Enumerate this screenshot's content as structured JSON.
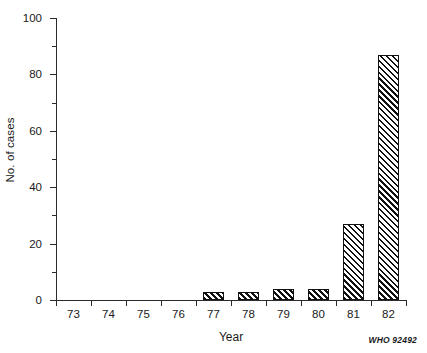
{
  "chart_data": {
    "type": "bar",
    "title": "",
    "subtitle": "",
    "xlabel": "Year",
    "ylabel": "No. of cases",
    "categories": [
      "73",
      "74",
      "75",
      "76",
      "77",
      "78",
      "79",
      "80",
      "81",
      "82"
    ],
    "values": [
      0,
      0,
      0,
      0,
      3,
      3,
      4,
      4,
      27,
      87
    ],
    "series": [
      {
        "name": "No. of cases",
        "values": [
          0,
          0,
          0,
          0,
          3,
          3,
          4,
          4,
          27,
          87
        ]
      }
    ],
    "ylim": [
      0,
      100
    ],
    "y_major_ticks": [
      0,
      20,
      40,
      60,
      80,
      100
    ],
    "y_major_tick_labels": [
      "0",
      "20",
      "40",
      "60",
      "80",
      "100"
    ],
    "y_minor_ticks": [
      10,
      30,
      50,
      70,
      90
    ],
    "grid": false,
    "legend": "none",
    "bar_fill": "diagonal-hatch",
    "bar_edge_color": "#111111",
    "axis_color": "#2b2b2b"
  },
  "credit": {
    "text": "WHO 92492"
  }
}
